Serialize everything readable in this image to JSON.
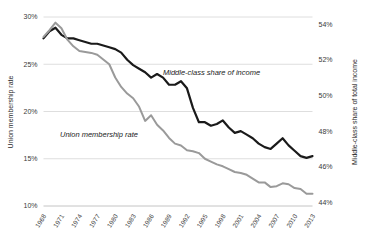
{
  "chart_data": {
    "type": "line",
    "title": "",
    "grid": true,
    "legend": "annotations-inline",
    "x": [
      1968,
      1969,
      1970,
      1971,
      1972,
      1973,
      1974,
      1975,
      1976,
      1977,
      1978,
      1979,
      1980,
      1981,
      1982,
      1983,
      1984,
      1985,
      1986,
      1987,
      1988,
      1989,
      1990,
      1991,
      1992,
      1993,
      1994,
      1995,
      1996,
      1997,
      1998,
      1999,
      2000,
      2001,
      2002,
      2003,
      2004,
      2005,
      2006,
      2007,
      2008,
      2009,
      2010,
      2011,
      2012,
      2013
    ],
    "xlabel": "",
    "xticks": [
      "1968",
      "1971",
      "1974",
      "1977",
      "1980",
      "1983",
      "1986",
      "1989",
      "1992",
      "1995",
      "1998",
      "2001",
      "2004",
      "2007",
      "2010",
      "2013"
    ],
    "axes": [
      {
        "id": "left",
        "label": "Union membership rate",
        "ticks": [
          "30%",
          "25%",
          "20%",
          "15%",
          "10%"
        ],
        "tick_values": [
          30,
          25,
          20,
          15,
          10
        ],
        "range": [
          10,
          30
        ]
      },
      {
        "id": "right",
        "label": "Middle-class share of total income",
        "ticks": [
          "54%",
          "52%",
          "50%",
          "48%",
          "46%",
          "44%"
        ],
        "tick_values": [
          54,
          52,
          50,
          48,
          46,
          44
        ],
        "range": [
          43.8,
          54.4
        ]
      }
    ],
    "series": [
      {
        "name": "Middle-class share of income",
        "axis": "right",
        "color": "#1a1a1a",
        "annotation": "Middle-class share of income",
        "values": [
          53.2,
          53.6,
          53.8,
          53.4,
          53.2,
          53.2,
          53.1,
          53.0,
          52.9,
          52.9,
          52.8,
          52.7,
          52.6,
          52.4,
          52.0,
          51.7,
          51.5,
          51.3,
          51.0,
          51.2,
          51.0,
          50.6,
          50.6,
          50.8,
          50.4,
          49.3,
          48.5,
          48.5,
          48.3,
          48.4,
          48.6,
          48.2,
          47.9,
          48.0,
          47.8,
          47.6,
          47.3,
          47.1,
          47.0,
          47.3,
          47.6,
          47.2,
          46.9,
          46.6,
          46.5,
          46.6
        ]
      },
      {
        "name": "Union membership rate",
        "axis": "left",
        "color": "#9a9a9a",
        "annotation": "Union membership rate",
        "values": [
          27.9,
          28.6,
          29.4,
          28.8,
          27.6,
          26.9,
          26.4,
          26.3,
          26.2,
          26.0,
          25.5,
          25.0,
          23.6,
          22.6,
          21.9,
          21.4,
          20.5,
          19.0,
          19.6,
          18.6,
          18.0,
          17.2,
          16.6,
          16.4,
          15.9,
          15.8,
          15.6,
          15.0,
          14.7,
          14.4,
          14.2,
          13.9,
          13.6,
          13.5,
          13.3,
          12.9,
          12.5,
          12.5,
          12.0,
          12.1,
          12.4,
          12.3,
          11.9,
          11.8,
          11.3,
          11.3
        ]
      }
    ]
  }
}
